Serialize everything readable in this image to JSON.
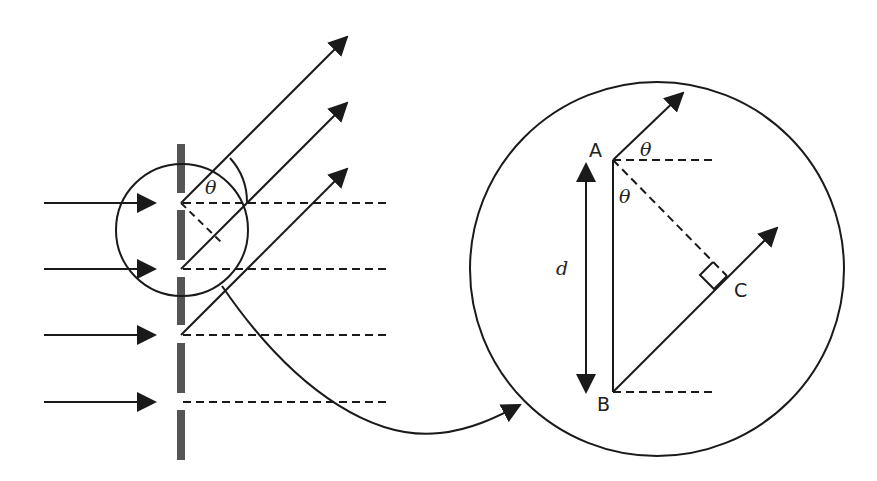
{
  "figure": {
    "left_panel": {
      "angle_label": "θ",
      "slit_count": 4
    },
    "zoom_panel": {
      "point_a": "A",
      "point_b": "B",
      "point_c": "C",
      "spacing_label": "d",
      "angle_top_label": "θ",
      "angle_inner_label": "θ"
    },
    "colors": {
      "line": "#1a1a1a",
      "grating": "#555555",
      "background": "#ffffff"
    }
  }
}
